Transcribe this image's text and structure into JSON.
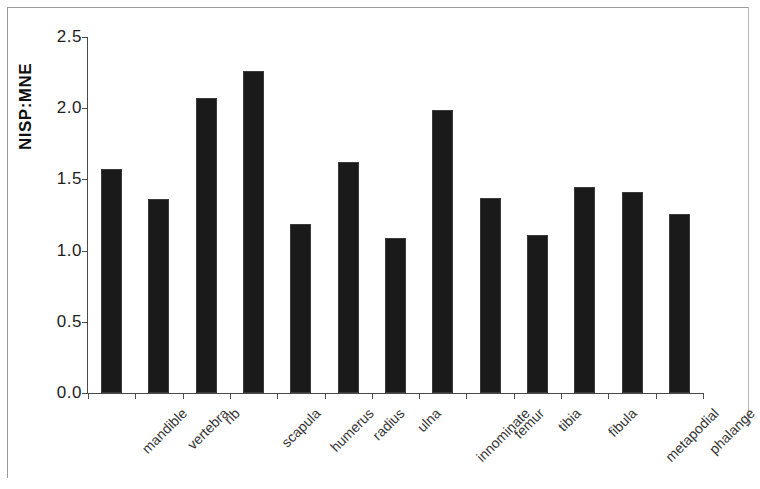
{
  "chart_data": {
    "type": "bar",
    "title": "",
    "xlabel": "",
    "ylabel": "NISP:MNE",
    "ylim": [
      0.0,
      2.5
    ],
    "yticks": [
      "0.0",
      "0.5",
      "1.0",
      "1.5",
      "2.0",
      "2.5"
    ],
    "ytick_values": [
      0.0,
      0.5,
      1.0,
      1.5,
      2.0,
      2.5
    ],
    "grid": false,
    "legend": "none",
    "bar_color": "#1a1a1a",
    "axis_color": "#4a4a4a",
    "categories": [
      "mandible",
      "vertebra",
      "rib",
      "scapula",
      "humerus",
      "radius",
      "ulna",
      "innominate",
      "femur",
      "tibia",
      "fibula",
      "metapodial",
      "phalange"
    ],
    "values": [
      1.57,
      1.36,
      2.07,
      2.26,
      1.19,
      1.62,
      1.09,
      1.99,
      1.37,
      1.11,
      1.45,
      1.41,
      1.26
    ]
  }
}
